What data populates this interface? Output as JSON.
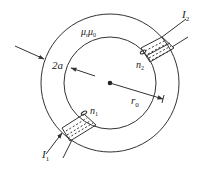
{
  "diagram": {
    "type": "toroid-with-two-windings",
    "colors": {
      "line": "#333333",
      "text": "#222222",
      "background": "#ffffff"
    },
    "labels": {
      "permeability": {
        "base": "μ",
        "sub1": "r",
        "base2": "μ",
        "sub2": "0"
      },
      "thickness": "2a",
      "radius": {
        "base": "r",
        "sub": "0"
      },
      "winding_top": {
        "base": "n",
        "sub": "2"
      },
      "winding_bottom": {
        "base": "n",
        "sub": "1"
      },
      "current_top": {
        "base": "I",
        "sub": "2"
      },
      "current_bottom": {
        "base": "I",
        "sub": "1"
      }
    },
    "geometry": {
      "center": [
        110,
        83
      ],
      "outer_radius": 69,
      "inner_radius": 46
    }
  }
}
